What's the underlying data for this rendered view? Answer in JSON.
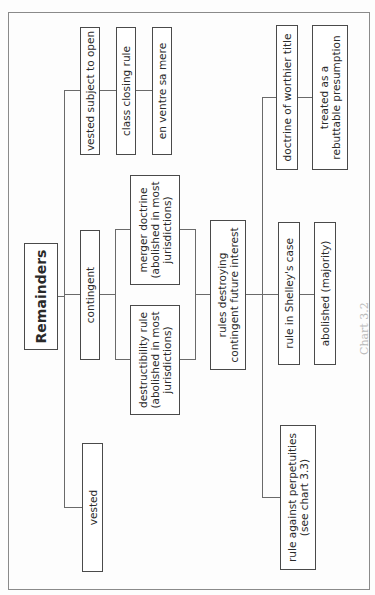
{
  "diagram": {
    "root": "Remainders",
    "nodes": {
      "vested": "vested",
      "contingent": "contingent",
      "vested_subject_to_open": "vested subject to open",
      "class_closing_rule": "class closing rule",
      "en_ventre_sa_mere": "en ventre sa mere",
      "destructibility_rule": [
        "destructibility rule",
        "(abolished in most",
        "jurisdictions)"
      ],
      "merger_doctrine": [
        "merger doctrine",
        "(abolished in most",
        "jurisdictions)"
      ],
      "rules_destroying": [
        "rules destroying",
        "contingent future interest"
      ],
      "rule_against_perpetuities": [
        "rule against perpetuities",
        "(see chart 3.3)"
      ],
      "rule_in_shelleys_case": "rule in Shelley's case",
      "abolished_majority": "abolished (majority)",
      "doctrine_of_worthier_title": "doctrine of worthier title",
      "treated_as_rebuttable": [
        "treated as a",
        "rebuttable presumption"
      ]
    },
    "edges": [
      [
        "Remainders",
        "vested"
      ],
      [
        "Remainders",
        "contingent"
      ],
      [
        "Remainders",
        "vested subject to open"
      ],
      [
        "vested subject to open",
        "class closing rule"
      ],
      [
        "class closing rule",
        "en ventre sa mere"
      ],
      [
        "contingent",
        "destructibility rule"
      ],
      [
        "contingent",
        "merger doctrine"
      ],
      [
        "destructibility rule",
        "rules destroying contingent future interest"
      ],
      [
        "merger doctrine",
        "rules destroying contingent future interest"
      ],
      [
        "rules destroying contingent future interest",
        "rule against perpetuities"
      ],
      [
        "rules destroying contingent future interest",
        "rule in Shelley's case"
      ],
      [
        "rules destroying contingent future interest",
        "doctrine of worthier title"
      ],
      [
        "rule in Shelley's case",
        "abolished (majority)"
      ],
      [
        "doctrine of worthier title",
        "treated as a rebuttable presumption"
      ]
    ],
    "caption_fragment": "Chart 3.2"
  }
}
